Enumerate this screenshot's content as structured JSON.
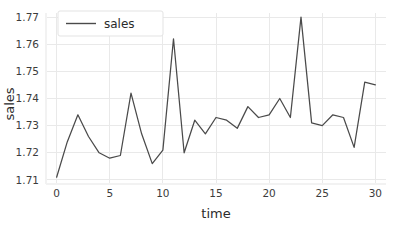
{
  "chart_data": {
    "type": "line",
    "title": "",
    "xlabel": "time",
    "ylabel": "sales",
    "xlim": [
      -1.0,
      31.0
    ],
    "ylim": [
      1.7085,
      1.7715
    ],
    "xticks": [
      0,
      5,
      10,
      15,
      20,
      25,
      30
    ],
    "xtick_labels": [
      "0",
      "5",
      "10",
      "15",
      "20",
      "25",
      "30"
    ],
    "yticks": [
      1.71,
      1.72,
      1.73,
      1.74,
      1.75,
      1.76,
      1.77
    ],
    "ytick_labels": [
      "1.71",
      "1.72",
      "1.73",
      "1.74",
      "1.75",
      "1.76",
      "1.77"
    ],
    "grid": true,
    "legend_position": "upper left",
    "series": [
      {
        "name": "sales",
        "color": "#4a4a4a",
        "x": [
          0,
          1,
          2,
          3,
          4,
          5,
          6,
          7,
          8,
          9,
          10,
          11,
          12,
          13,
          14,
          15,
          16,
          17,
          18,
          19,
          20,
          21,
          22,
          23,
          24,
          25,
          26,
          27,
          28,
          29,
          30
        ],
        "values": [
          1.711,
          1.724,
          1.734,
          1.726,
          1.72,
          1.718,
          1.719,
          1.742,
          1.727,
          1.716,
          1.721,
          1.762,
          1.72,
          1.732,
          1.727,
          1.733,
          1.732,
          1.729,
          1.737,
          1.733,
          1.734,
          1.74,
          1.733,
          1.77,
          1.731,
          1.73,
          1.734,
          1.733,
          1.722,
          1.746,
          1.745
        ]
      }
    ]
  },
  "legend": {
    "entries": [
      {
        "label": "sales"
      }
    ]
  },
  "axes": {
    "x_title": "time",
    "y_title": "sales"
  }
}
